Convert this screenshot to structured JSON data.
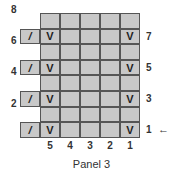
{
  "caption": "Panel 3",
  "rows": [
    {
      "num": "8",
      "side": "left",
      "extra": null,
      "cells": [
        "",
        "",
        "",
        "",
        ""
      ]
    },
    {
      "num": "7",
      "side": "right",
      "extra": "/",
      "cells": [
        "V",
        "",
        "",
        "",
        "V"
      ]
    },
    {
      "num": "6",
      "side": "left",
      "extra": null,
      "cells": [
        "",
        "",
        "",
        "",
        ""
      ]
    },
    {
      "num": "5",
      "side": "right",
      "extra": "/",
      "cells": [
        "V",
        "",
        "",
        "",
        "V"
      ]
    },
    {
      "num": "4",
      "side": "left",
      "extra": null,
      "cells": [
        "",
        "",
        "",
        "",
        ""
      ]
    },
    {
      "num": "3",
      "side": "right",
      "extra": "/",
      "cells": [
        "V",
        "",
        "",
        "",
        "V"
      ]
    },
    {
      "num": "2",
      "side": "left",
      "extra": null,
      "cells": [
        "",
        "",
        "",
        "",
        ""
      ]
    },
    {
      "num": "1",
      "side": "right",
      "extra": "/",
      "cells": [
        "V",
        "",
        "",
        "",
        "V"
      ]
    }
  ],
  "column_labels": [
    "5",
    "4",
    "3",
    "2",
    "1"
  ],
  "start_arrow": "←",
  "colors": {
    "cell": "#c8c8c8",
    "border": "#555555"
  }
}
